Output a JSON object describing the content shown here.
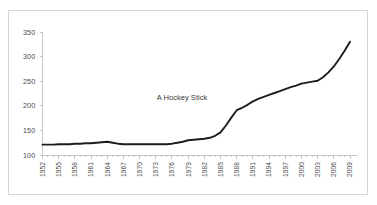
{
  "chart_data": {
    "type": "line",
    "title": "",
    "annotation": "A Hockey Stick",
    "xlabel": "",
    "ylabel": "",
    "xlim": [
      1952,
      2010
    ],
    "ylim": [
      100,
      350
    ],
    "grid": false,
    "legend": false,
    "y_ticks": [
      100,
      150,
      200,
      250,
      300,
      350
    ],
    "x_tick_labels": [
      "1952",
      "1955",
      "1958",
      "1961",
      "1964",
      "1967",
      "1970",
      "1973",
      "1976",
      "1979",
      "1982",
      "1985",
      "1988",
      "1991",
      "1994",
      "1997",
      "2000",
      "2003",
      "2006",
      "2009"
    ],
    "x_tick_step_years": 3,
    "x": [
      1952,
      1953,
      1954,
      1955,
      1956,
      1957,
      1958,
      1959,
      1960,
      1961,
      1962,
      1963,
      1964,
      1965,
      1966,
      1967,
      1968,
      1969,
      1970,
      1971,
      1972,
      1973,
      1974,
      1975,
      1976,
      1977,
      1978,
      1979,
      1980,
      1981,
      1982,
      1983,
      1984,
      1985,
      1986,
      1987,
      1988,
      1989,
      1990,
      1991,
      1992,
      1993,
      1994,
      1995,
      1996,
      1997,
      1998,
      1999,
      2000,
      2001,
      2002,
      2003,
      2004,
      2005,
      2006,
      2007,
      2008,
      2009
    ],
    "values": [
      121,
      121,
      121,
      122,
      122,
      122,
      123,
      123,
      124,
      124,
      125,
      126,
      127,
      125,
      123,
      122,
      122,
      122,
      122,
      122,
      122,
      122,
      122,
      122,
      123,
      125,
      127,
      130,
      131,
      132,
      133,
      135,
      139,
      146,
      160,
      176,
      191,
      196,
      202,
      209,
      214,
      218,
      222,
      226,
      230,
      234,
      238,
      241,
      245,
      247,
      249,
      251,
      258,
      268,
      280,
      295,
      312,
      330
    ],
    "series_color": "#1c1c1c",
    "axis_color": "#b9b9b9",
    "label_color": "#4a4a4a",
    "background_color": "#ffffff",
    "frame_color": "#d6d6d6"
  }
}
